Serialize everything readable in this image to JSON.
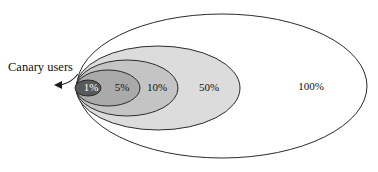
{
  "figure": {
    "background_color": "#ffffff",
    "outline_color": "#2b2b2b",
    "width": 378,
    "height": 172
  },
  "annotation": {
    "label": "Canary users",
    "x": 8,
    "y": 68,
    "arrow_path": "M 78 74 C 72 82, 66 84, 60 85",
    "pointer_color": "#1a1a1a"
  },
  "chart_data": {
    "type": "venn",
    "shared_focus": {
      "x": 77,
      "y": 88
    },
    "stages": [
      {
        "label": "100%",
        "value": 100,
        "fill": "#ffffff",
        "stroke": "#2b2b2b",
        "label_fill": "light-bg",
        "cx": 222,
        "cy": 86,
        "rx": 145,
        "ry": 72,
        "label_x": 311,
        "label_y": 87
      },
      {
        "label": "50%",
        "value": 50,
        "fill": "#dcdcdc",
        "stroke": "#2b2b2b",
        "label_fill": "light-bg",
        "cx": 158,
        "cy": 88,
        "rx": 82,
        "ry": 42,
        "label_x": 209,
        "label_y": 88
      },
      {
        "label": "10%",
        "value": 10,
        "fill": "#c4c4c4",
        "stroke": "#2b2b2b",
        "label_fill": "light-bg",
        "cx": 127,
        "cy": 88,
        "rx": 51,
        "ry": 28,
        "label_x": 157,
        "label_y": 88
      },
      {
        "label": "5%",
        "value": 5,
        "fill": "#aaaaaa",
        "stroke": "#2b2b2b",
        "label_fill": "light-bg",
        "cx": 108,
        "cy": 88,
        "rx": 32,
        "ry": 18,
        "label_x": 122,
        "label_y": 88
      },
      {
        "label": "1%",
        "value": 1,
        "fill": "#595959",
        "stroke": "#2b2b2b",
        "label_fill": "dark-bg",
        "cx": 88,
        "cy": 88,
        "rx": 13,
        "ry": 8,
        "label_x": 91,
        "label_y": 88
      }
    ],
    "legend": null,
    "xlabel": "",
    "ylabel": "",
    "grid": false
  }
}
